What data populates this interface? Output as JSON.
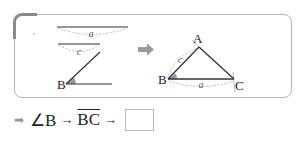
{
  "diagram": {
    "left": {
      "segment_a_label": "a",
      "segment_c_label": "c",
      "vertex_b_label": "B"
    },
    "arrow_icon": "right-arrow",
    "right": {
      "vertex_a_label": "A",
      "vertex_b_label": "B",
      "vertex_c_label": "C",
      "side_c_label": "c",
      "side_a_label": "a"
    },
    "colors": {
      "line": "#333333",
      "dashed": "#999999",
      "frame": "#b5b5b5",
      "accent": "#8a8a8a",
      "angle_fill": "#9a9a9a"
    }
  },
  "sequence": {
    "lead_arrow": "➡",
    "step1": "∠B",
    "arrow1": "→",
    "step2": "BC",
    "arrow2": "→",
    "answer_blank": ""
  }
}
